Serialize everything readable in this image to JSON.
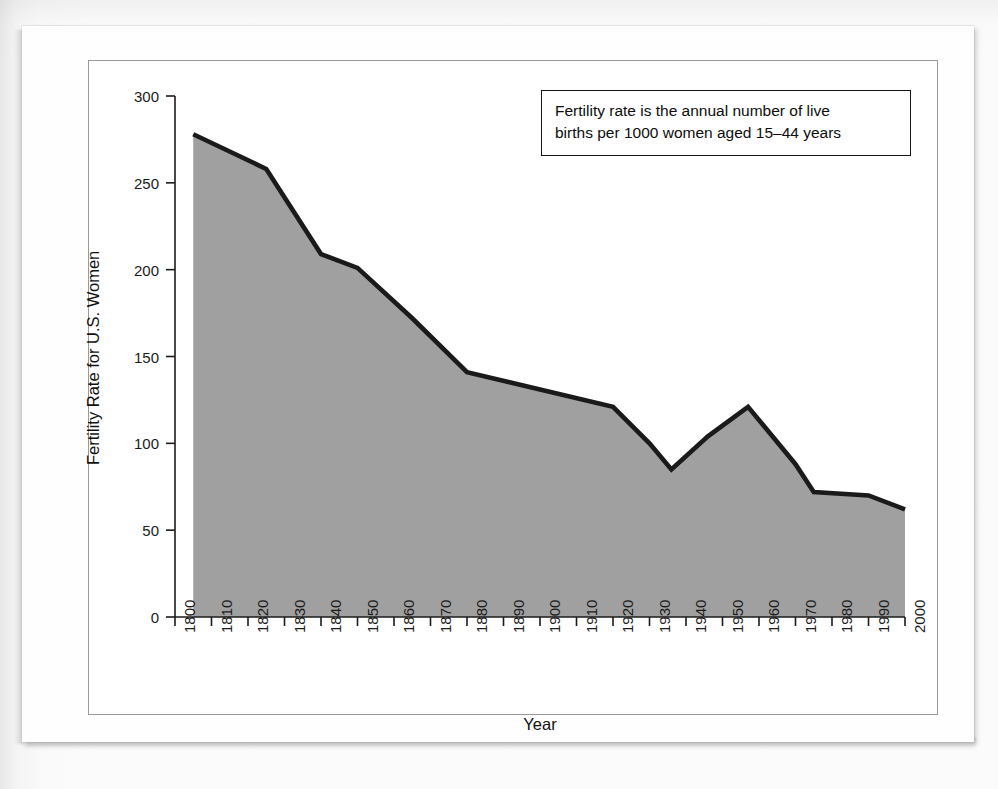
{
  "figure": {
    "annotation": {
      "line1": "Fertility rate is the annual number of live",
      "line2": "births per 1000 women aged 15–44 years"
    }
  },
  "chart_data": {
    "type": "area",
    "title": "",
    "xlabel": "Year",
    "ylabel": "Fertility Rate for U.S. Women",
    "xlim": [
      1800,
      2000
    ],
    "ylim": [
      0,
      300
    ],
    "xticks": [
      1800,
      1810,
      1820,
      1830,
      1840,
      1850,
      1860,
      1870,
      1880,
      1890,
      1900,
      1910,
      1920,
      1930,
      1940,
      1950,
      1960,
      1970,
      1980,
      1990,
      2000
    ],
    "yticks": [
      0,
      50,
      100,
      150,
      200,
      250,
      300
    ],
    "xtick_labels": [
      "1800",
      "1810",
      "1820",
      "1830",
      "1840",
      "1850",
      "1860",
      "1870",
      "1880",
      "1890",
      "1900",
      "1910",
      "1920",
      "1930",
      "1940",
      "1950",
      "1960",
      "1970",
      "1980",
      "1990",
      "2000"
    ],
    "ytick_labels": [
      "0",
      "50",
      "100",
      "150",
      "200",
      "250",
      "300"
    ],
    "grid": false,
    "legend": false,
    "series": [
      {
        "name": "Fertility rate for U.S. women",
        "x": [
          1805,
          1825,
          1840,
          1850,
          1865,
          1880,
          1900,
          1920,
          1930,
          1936,
          1946,
          1957,
          1970,
          1975,
          1990,
          2000
        ],
        "values": [
          278,
          258,
          209,
          201,
          172,
          141,
          131,
          121,
          100,
          85,
          104,
          121,
          88,
          72,
          70,
          62
        ]
      }
    ],
    "colors": {
      "line": "#1a1a1a",
      "fill": "#a0a0a0",
      "axis": "#1b1b1b",
      "annotation_border": "#141414",
      "figure_background": "#ffffff",
      "page_background": "#fdfdfd"
    },
    "annotations": [
      "Fertility rate is the annual number of live births per 1000 women aged 15–44 years"
    ]
  }
}
